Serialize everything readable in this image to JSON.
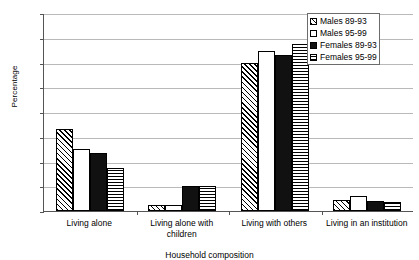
{
  "chart_data": {
    "type": "bar",
    "title": "",
    "xlabel": "Household composition",
    "ylabel": "Percentage",
    "ylim": [
      0,
      80
    ],
    "yticks": [
      0,
      10,
      20,
      30,
      40,
      50,
      60,
      70,
      80
    ],
    "grid": true,
    "legend_position": "top-right",
    "categories": [
      "Living alone",
      "Living alone with children",
      "Living with others",
      "Living in an institution"
    ],
    "series": [
      {
        "name": "Males 89-93",
        "pattern": "diagonal-hatch",
        "values": [
          33,
          2.5,
          60,
          4.5
        ]
      },
      {
        "name": "Males 95-99",
        "pattern": "white-empty",
        "values": [
          25,
          2.5,
          64.5,
          6
        ]
      },
      {
        "name": "Females 89-93",
        "pattern": "solid-black",
        "values": [
          23.5,
          10,
          63,
          4
        ]
      },
      {
        "name": "Females 95-99",
        "pattern": "horizontal-lines",
        "values": [
          17.5,
          10,
          67.5,
          3.5
        ]
      }
    ]
  },
  "legend": {
    "items": [
      {
        "label": "Males 89-93"
      },
      {
        "label": "Males 95-99"
      },
      {
        "label": "Females 89-93"
      },
      {
        "label": "Females 95-99"
      }
    ]
  },
  "axis": {
    "y_title": "Percentage",
    "x_title": "Household composition",
    "y_ticks": [
      "80",
      "70",
      "60",
      "50",
      "40",
      "30",
      "20",
      "10",
      "0"
    ]
  },
  "colors": {
    "bar_outline": "#000000",
    "grid": "#b9b9b9",
    "axis": "#555555",
    "background": "#ffffff"
  }
}
